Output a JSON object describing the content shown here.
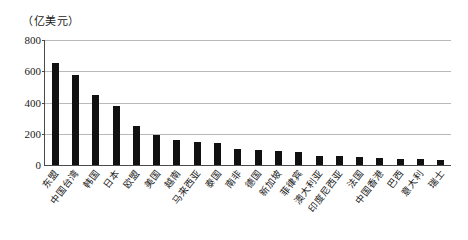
{
  "chart_data": {
    "type": "bar",
    "title": "",
    "subtitle": "",
    "unit_label": "（亿美元）",
    "xlabel": "",
    "ylabel": "",
    "ylim": [
      0,
      800
    ],
    "yticks": [
      0,
      200,
      400,
      600,
      800
    ],
    "grid": true,
    "legend": false,
    "bar_color": "#111111",
    "axis_color": "#4a4a4a",
    "grid_color": "#b9b9b9",
    "categories": [
      "东盟",
      "中国台湾",
      "韩国",
      "日本",
      "欧盟",
      "美国",
      "越南",
      "马来西亚",
      "泰国",
      "南非",
      "德国",
      "新加坡",
      "菲律宾",
      "澳大利亚",
      "印度尼西亚",
      "法国",
      "中国香港",
      "巴西",
      "意大利",
      "瑞士"
    ],
    "values": [
      650,
      575,
      445,
      380,
      250,
      190,
      160,
      150,
      140,
      100,
      95,
      90,
      85,
      60,
      55,
      50,
      45,
      40,
      38,
      35
    ]
  }
}
